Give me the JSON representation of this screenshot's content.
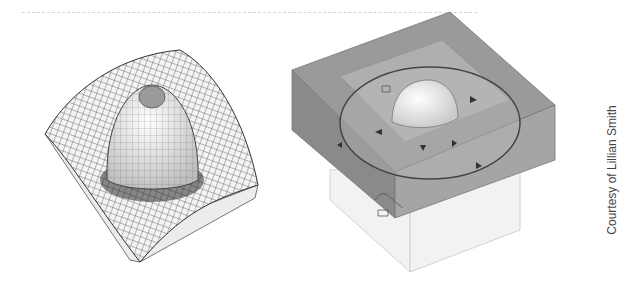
{
  "figure": {
    "left_panel": {
      "description": "Wireframe mesh surface with central dome peak in a square basin"
    },
    "right_panel": {
      "description": "Translucent box model with dome, circular boundary and directional arrow markers"
    },
    "credit": "Courtesy of Lillian Smith"
  },
  "colors": {
    "mesh_line": "#333333",
    "surface": "#e8e8e8",
    "box_dark": "#8f8f8f",
    "box_light": "#dcdcdc"
  }
}
